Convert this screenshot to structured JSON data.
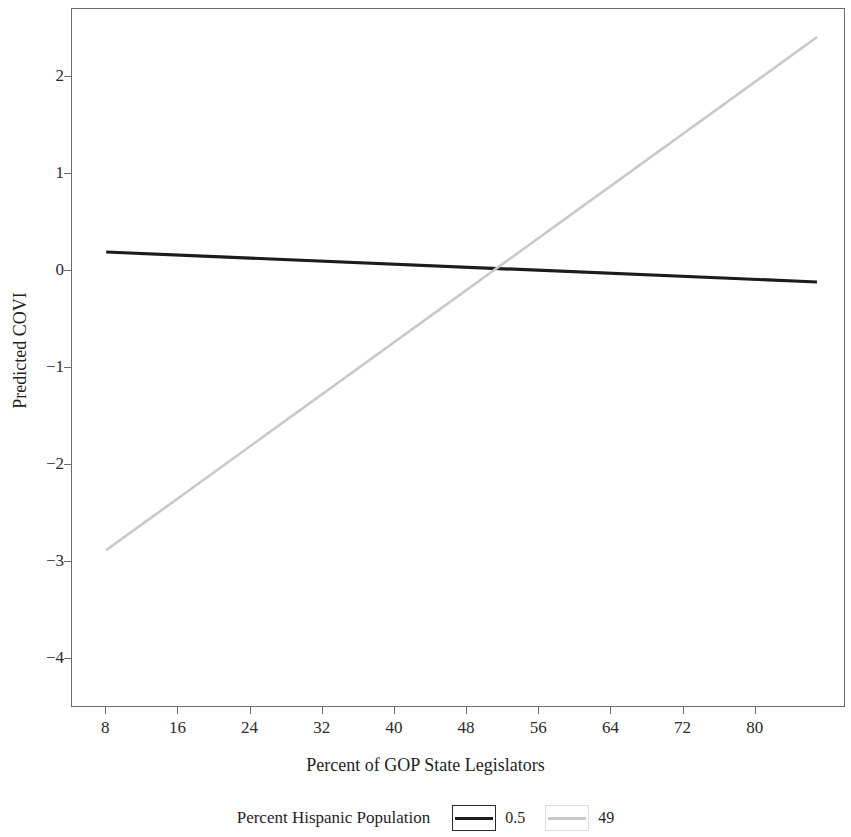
{
  "chart_data": {
    "type": "line",
    "title": "",
    "xlabel": "Percent of GOP State Legislators",
    "ylabel": "Predicted COVI",
    "xlim": [
      4.2,
      90.0
    ],
    "ylim": [
      -4.5,
      2.7
    ],
    "xticks": [
      8,
      16,
      24,
      32,
      40,
      48,
      56,
      64,
      72,
      80
    ],
    "yticks": [
      2,
      1,
      0,
      -1,
      -2,
      -3,
      -4
    ],
    "xticklabels": [
      "8",
      "16",
      "24",
      "32",
      "40",
      "48",
      "56",
      "64",
      "72",
      "80"
    ],
    "yticklabels": [
      "2",
      "1",
      "0",
      "−1",
      "−2",
      "−3",
      "−4"
    ],
    "grid": false,
    "legend_position": "bottom",
    "legend_title": "Percent Hispanic Population",
    "series": [
      {
        "name": "0.5",
        "color": "#1c1c1c",
        "linewidth": 3.2,
        "x": [
          8,
          87
        ],
        "values": [
          0.19,
          -0.12
        ]
      },
      {
        "name": "49",
        "color": "#c9c9c9",
        "linewidth": 2.6,
        "x": [
          8,
          87
        ],
        "values": [
          -2.89,
          2.41
        ]
      }
    ],
    "annotations": [
      {
        "text": "lines intersect",
        "x": 51,
        "y": 0.0
      }
    ]
  },
  "axes": {
    "y_title": "Predicted COVI",
    "x_title": "Percent of GOP State Legislators",
    "y_tick_labels": [
      "2",
      "1",
      "0",
      "−1",
      "−2",
      "−3",
      "−4"
    ],
    "x_tick_labels": [
      "8",
      "16",
      "24",
      "32",
      "40",
      "48",
      "56",
      "64",
      "72",
      "80"
    ]
  },
  "legend": {
    "title": "Percent Hispanic Population",
    "entries": [
      {
        "label": "0.5",
        "color": "#1c1c1c",
        "box_color": "#2b2b2b"
      },
      {
        "label": "49",
        "color": "#c9c9c9",
        "box_color": "#dddddd"
      }
    ]
  },
  "colors": {
    "frame": "#6b6b6b",
    "background": "#ffffff",
    "text": "#1f1f1f",
    "series_dark": "#1c1c1c",
    "series_light": "#c9c9c9"
  }
}
